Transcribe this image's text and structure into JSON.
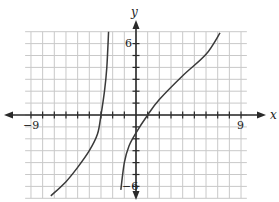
{
  "chart_data": {
    "type": "line",
    "title": "",
    "xlabel": "x",
    "ylabel": "y",
    "xlim": [
      -9,
      9
    ],
    "ylim": [
      -6,
      6
    ],
    "grid": true,
    "x_ticks_labeled": [
      "-9",
      "9"
    ],
    "y_ticks_labeled": [
      "6",
      "-6"
    ],
    "tick_step": 1,
    "vertical_asymptote_x": -2,
    "series": [
      {
        "name": "left branch",
        "points": [
          [
            -7.3,
            -6.8
          ],
          [
            -6,
            -5.6
          ],
          [
            -5,
            -4.4
          ],
          [
            -4,
            -3.0
          ],
          [
            -3.3,
            -1.6
          ],
          [
            -3.0,
            0
          ],
          [
            -2.7,
            2.0
          ],
          [
            -2.5,
            4.0
          ],
          [
            -2.35,
            7.0
          ]
        ]
      },
      {
        "name": "right branch",
        "points": [
          [
            -1.3,
            -6.3
          ],
          [
            -1.0,
            -4.0
          ],
          [
            -0.6,
            -2.6
          ],
          [
            0,
            -1.5
          ],
          [
            1.0,
            0
          ],
          [
            2,
            1.3
          ],
          [
            4,
            3.3
          ],
          [
            6,
            5.1
          ],
          [
            7.2,
            6.9
          ]
        ]
      }
    ]
  },
  "labels": {
    "x_axis": "x",
    "y_axis": "y",
    "x_min": "−9",
    "x_max": "9",
    "y_max": "6",
    "y_min": "−6"
  }
}
